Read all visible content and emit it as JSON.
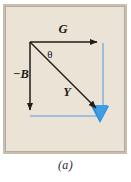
{
  "figure": {
    "caption": "(a)",
    "panel_background": "#ece3d7",
    "frame_background": "#c9bfb0",
    "vector_color": "#211d18",
    "guide_color": "#8ab4dd",
    "resultant_arrow_color": "#2f8fd8",
    "labels": {
      "horizontal_vector": "G",
      "vertical_vector": "−B",
      "resultant_vector": "Y",
      "angle": "θ"
    },
    "geometry": {
      "origin": {
        "x": 25,
        "y": 36
      },
      "horizontal_tip": {
        "x": 98,
        "y": 36
      },
      "vertical_tip": {
        "x": 25,
        "y": 110
      },
      "resultant_tip": {
        "x": 98,
        "y": 110
      }
    }
  }
}
